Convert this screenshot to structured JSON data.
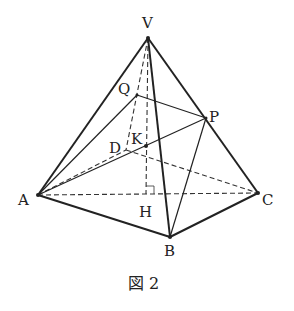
{
  "figure": {
    "caption": "図 2",
    "points": {
      "V": {
        "label": "V",
        "x": 148,
        "y": 38
      },
      "A": {
        "label": "A",
        "x": 38,
        "y": 195
      },
      "B": {
        "label": "B",
        "x": 170,
        "y": 237
      },
      "C": {
        "label": "C",
        "x": 258,
        "y": 193
      },
      "H": {
        "label": "H",
        "x": 146,
        "y": 194
      },
      "P": {
        "label": "P",
        "x": 206,
        "y": 118
      },
      "Q": {
        "label": "Q",
        "x": 137,
        "y": 95
      },
      "K": {
        "label": "K",
        "x": 146,
        "y": 146
      },
      "D": {
        "label": "D",
        "x": 126,
        "y": 150
      }
    },
    "solid_edges": [
      "VA",
      "VB",
      "VC",
      "AB",
      "BC",
      "AQ",
      "AP",
      "QP",
      "PB"
    ],
    "dashed_edges": [
      "AC",
      "VH",
      "VD",
      "AD",
      "DC"
    ]
  }
}
